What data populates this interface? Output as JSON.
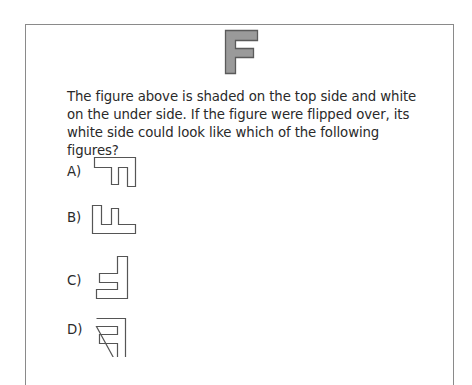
{
  "reference_figure": {
    "letter": "F",
    "icon": "shaded-f-shape",
    "fill_color": "#9a9a9a",
    "stroke_color": "#5a5a5a"
  },
  "question": {
    "text": "The figure above is shaded on the top side and white on the under side. If the figure were flipped over, its white side could look like which of the following figures?"
  },
  "options": [
    {
      "label": "A)",
      "shape": "outline-figure-a"
    },
    {
      "label": "B)",
      "shape": "outline-figure-b"
    },
    {
      "label": "C)",
      "shape": "outline-figure-c"
    },
    {
      "label": "D)",
      "shape": "outline-figure-d"
    }
  ],
  "colors": {
    "border": "#8a8a8a",
    "outline": "#555555",
    "text": "#2a2a2a"
  }
}
